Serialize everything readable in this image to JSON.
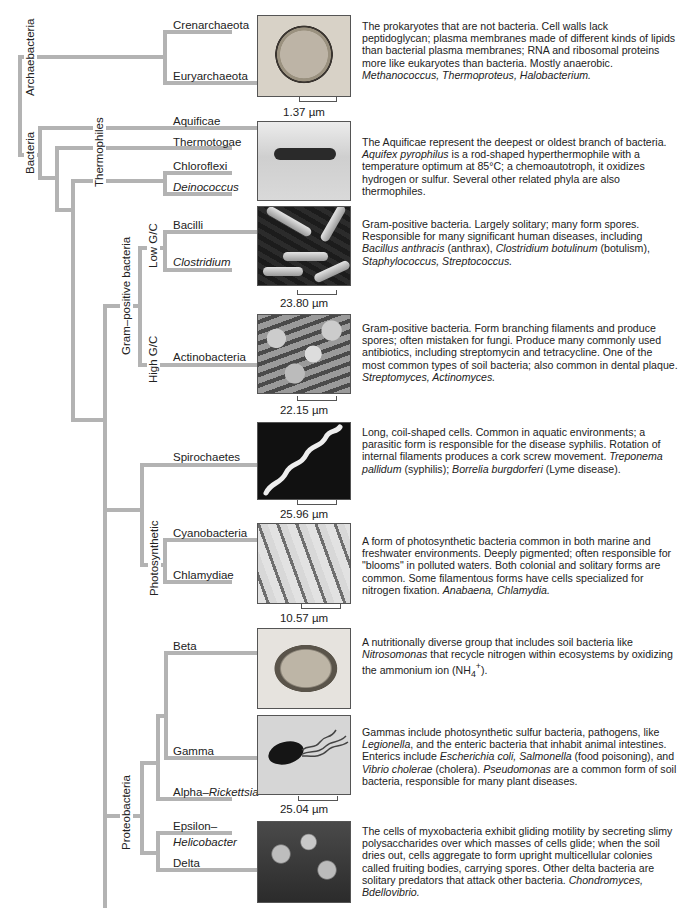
{
  "figure": {
    "type": "phylogenetic-tree",
    "branch_color": "#b3b3b3",
    "groups": {
      "archaebacteria": "Archaebacteria",
      "bacteria": "Bacteria",
      "thermophiles": "Thermophiles",
      "gram_positive": "Gram–positive bacteria",
      "low_gc": "Low G/C",
      "high_gc": "High G/C",
      "photosynthetic": "Photosynthetic",
      "proteobacteria": "Proteobacteria"
    },
    "taxa": {
      "crenarchaeota": "Crenarchaeota",
      "euryarchaeota": "Euryarchaeota",
      "aquificae": "Aquificae",
      "thermotogae": "Thermotogae",
      "chloroflexi": "Chloroflexi",
      "deinococcus": "Deinococcus",
      "bacilli": "Bacilli",
      "clostridium": "Clostridium",
      "actinobacteria": "Actinobacteria",
      "spirochaetes": "Spirochaetes",
      "cyanobacteria": "Cyanobacteria",
      "chlamydiae": "Chlamydiae",
      "beta": "Beta",
      "gamma": "Gamma",
      "alpha": "Alpha–",
      "alpha_italic": "Rickettsia",
      "epsilon": "Epsilon–",
      "epsilon_italic": "Helicobacter",
      "delta": "Delta"
    },
    "scales": {
      "archaea": "1.37 µm",
      "bacilli": "23.80 µm",
      "actino": "22.15 µm",
      "spiro": "25.96 µm",
      "cyano": "10.57 µm",
      "gamma": "25.04 µm"
    },
    "photos": [
      "archaea-micrograph",
      "aquificae-micrograph",
      "bacilli-micrograph",
      "actinobacteria-micrograph",
      "spirochaete-micrograph",
      "cyanobacteria-micrograph",
      "beta-proteobacteria-micrograph",
      "gamma-proteobacteria-micrograph",
      "myxobacteria-micrograph"
    ],
    "descriptions": {
      "archaea": [
        {
          "t": "The prokaryotes that are not bacteria. Cell walls lack peptidoglycan; plasma membranes made of different kinds of lipids than bacterial plasma membranes; RNA and ribosomal proteins more like eukaryotes than bacteria. Mostly anaerobic. "
        },
        {
          "i": "Methanococcus, Thermoproteus, Halobacterium."
        }
      ],
      "aquificae": [
        {
          "t": "The Aquificae represent the deepest or oldest branch of bacteria. "
        },
        {
          "i": "Aquifex pyrophilus"
        },
        {
          "t": " is a rod-shaped hyperthermophile with a temperature optimum at 85°C; a chemoautotroph, it oxidizes hydrogen or sulfur. Several other related phyla are also thermophiles."
        }
      ],
      "bacilli": [
        {
          "t": "Gram-positive bacteria. Largely solitary; many form spores. Responsible for many significant human diseases, including "
        },
        {
          "i": "Bacillus anthracis"
        },
        {
          "t": " (anthrax), "
        },
        {
          "i": "Clostridium botulinum"
        },
        {
          "t": " (botulism), "
        },
        {
          "i": "Staphylococcus, Streptococcus."
        }
      ],
      "actino": [
        {
          "t": "Gram-positive bacteria. Form branching filaments and produce spores; often mistaken for fungi. Produce many commonly used antibiotics, including streptomycin and tetracycline. One of the most common types of soil bacteria; also common in dental plaque. "
        },
        {
          "i": "Streptomyces, Actinomyces."
        }
      ],
      "spiro": [
        {
          "t": "Long, coil-shaped cells. Common in aquatic environments; a parasitic form is responsible for the disease syphilis. Rotation of internal filaments produces a cork screw movement. "
        },
        {
          "i": "Treponema pallidum"
        },
        {
          "t": " (syphilis); "
        },
        {
          "i": "Borrelia burgdorferi"
        },
        {
          "t": " (Lyme disease)."
        }
      ],
      "cyano": [
        {
          "t": "A form of photosynthetic bacteria common in both marine and freshwater environments. Deeply pigmented; often responsible for \"blooms\" in polluted waters. Both colonial and solitary forms are common. Some filamentous forms have cells specialized for nitrogen fixation. "
        },
        {
          "i": "Anabaena, Chlamydia."
        }
      ],
      "beta": [
        {
          "t": "A nutritionally diverse group that includes soil bacteria like "
        },
        {
          "i": "Nitrosomonas"
        },
        {
          "t": " that recycle nitrogen within ecosystems by oxidizing the ammonium ion (NH"
        },
        {
          "sub": "4"
        },
        {
          "sup": "+"
        },
        {
          "t": ")."
        }
      ],
      "gamma": [
        {
          "t": "Gammas include photosynthetic sulfur bacteria, pathogens, like "
        },
        {
          "i": "Legionella"
        },
        {
          "t": ", and the enteric bacteria that inhabit animal intestines. Enterics include "
        },
        {
          "i": "Escherichia coli, Salmonella"
        },
        {
          "t": " (food poisoning), and "
        },
        {
          "i": "Vibrio cholerae"
        },
        {
          "t": " (cholera). "
        },
        {
          "i": "Pseudomonas"
        },
        {
          "t": " are a common form of soil bacteria, responsible for many plant diseases."
        }
      ],
      "delta": [
        {
          "t": "The cells of myxobacteria exhibit gliding motility by secreting slimy polysaccharides over which masses of cells glide; when the soil dries out, cells aggregate to form upright multicellular colonies called fruiting bodies, carrying spores. Other delta bacteria are solitary predators that attack other bacteria. "
        },
        {
          "i": "Chondromyces, Bdellovibrio."
        }
      ]
    }
  }
}
